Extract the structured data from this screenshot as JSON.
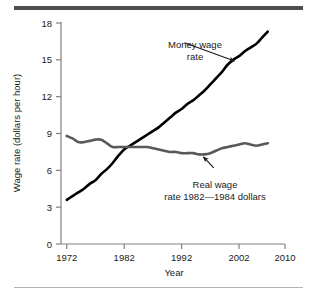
{
  "figure": {
    "top_rule_color": "#4d4d4d",
    "bottom_rule_color": "#b3b3b3",
    "background": "#ffffff"
  },
  "chart_data": {
    "type": "line",
    "title": "",
    "xlabel": "Year",
    "ylabel": "Wage rate (dollars per hour)",
    "xlim": [
      1971,
      2010
    ],
    "ylim": [
      0,
      18
    ],
    "xticks": [
      1972,
      1982,
      1992,
      2002,
      2010
    ],
    "xtick_labels": [
      "1972",
      "1982",
      "1992",
      "2002",
      "2010"
    ],
    "yticks": [
      0,
      3,
      6,
      9,
      12,
      15,
      18
    ],
    "ytick_labels": [
      "0",
      "3",
      "6",
      "9",
      "12",
      "15",
      "18"
    ],
    "grid": false,
    "legend_position": "annotations-inline",
    "series": [
      {
        "name": "Money wage rate",
        "color": "#000000",
        "line_width": 2.6,
        "x": [
          1972,
          1973,
          1974,
          1975,
          1976,
          1977,
          1978,
          1979,
          1980,
          1981,
          1982,
          1983,
          1984,
          1985,
          1986,
          1987,
          1988,
          1989,
          1990,
          1991,
          1992,
          1993,
          1994,
          1995,
          1996,
          1997,
          1998,
          1999,
          2000,
          2001,
          2002,
          2003,
          2004,
          2005,
          2006,
          2007
        ],
        "values": [
          3.6,
          3.9,
          4.2,
          4.5,
          4.9,
          5.2,
          5.7,
          6.1,
          6.6,
          7.2,
          7.7,
          8.0,
          8.3,
          8.6,
          8.9,
          9.2,
          9.5,
          9.9,
          10.3,
          10.7,
          11.0,
          11.4,
          11.7,
          12.1,
          12.5,
          13.0,
          13.5,
          14.0,
          14.6,
          15.0,
          15.3,
          15.7,
          16.0,
          16.3,
          16.8,
          17.3
        ],
        "annotation": {
          "text_line1": "Money wage",
          "text_line2": "rate",
          "arrow_from": [
            1992.5,
            16.4
          ],
          "arrow_to": [
            2001.2,
            14.9
          ]
        }
      },
      {
        "name": "Real wage rate 1982—1984 dollars",
        "color": "#595959",
        "line_width": 2.6,
        "x": [
          1972,
          1973,
          1974,
          1975,
          1976,
          1977,
          1978,
          1979,
          1980,
          1981,
          1982,
          1983,
          1984,
          1985,
          1986,
          1987,
          1988,
          1989,
          1990,
          1991,
          1992,
          1993,
          1994,
          1995,
          1996,
          1997,
          1998,
          1999,
          2000,
          2001,
          2002,
          2003,
          2004,
          2005,
          2006,
          2007
        ],
        "values": [
          8.8,
          8.6,
          8.3,
          8.3,
          8.4,
          8.5,
          8.5,
          8.2,
          7.9,
          7.9,
          7.9,
          7.9,
          7.9,
          7.9,
          7.9,
          7.8,
          7.7,
          7.6,
          7.5,
          7.5,
          7.4,
          7.4,
          7.4,
          7.3,
          7.3,
          7.4,
          7.6,
          7.8,
          7.9,
          8.0,
          8.1,
          8.2,
          8.1,
          8.0,
          8.1,
          8.2
        ],
        "annotation": {
          "text_line1": "Real wage",
          "text_line2": "rate 1982—1984 dollars",
          "arrow_from": [
            1997.6,
            6.2
          ],
          "arrow_to": [
            1995.8,
            7.1
          ]
        }
      }
    ]
  }
}
